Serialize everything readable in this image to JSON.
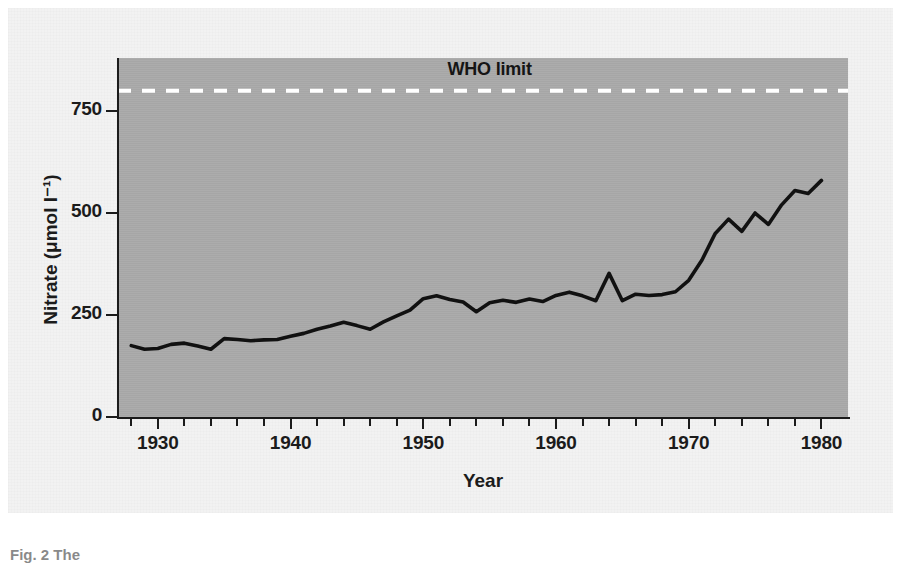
{
  "figure": {
    "caption": "Fig. 2 The",
    "page_background": "#ffffff",
    "card_background": "#f2f2f2"
  },
  "chart_data": {
    "type": "line",
    "title": "",
    "xlabel": "Year",
    "ylabel": "Nitrate (μmol l⁻¹)",
    "xlim": [
      1927,
      1982
    ],
    "ylim": [
      0,
      880
    ],
    "grid": false,
    "legend_position": "none",
    "plot_background": "#a9a9a9",
    "line_color": "#111111",
    "x_ticks_major": [
      1930,
      1940,
      1950,
      1960,
      1970,
      1980
    ],
    "x_tick_labels": [
      "1930",
      "1940",
      "1950",
      "1960",
      "1970",
      "1980"
    ],
    "x_tick_minor_step": 2,
    "y_ticks_major": [
      0,
      250,
      500,
      750
    ],
    "y_tick_labels": [
      "0",
      "250",
      "500",
      "750"
    ],
    "annotations": [
      {
        "name": "who-limit",
        "label": "WHO limit",
        "value": 800,
        "style": "dashed",
        "color": "#ffffff",
        "label_x": 1955
      }
    ],
    "series": [
      {
        "name": "Nitrate concentration",
        "x": [
          1928,
          1929,
          1930,
          1931,
          1932,
          1933,
          1934,
          1935,
          1936,
          1937,
          1938,
          1939,
          1940,
          1941,
          1942,
          1943,
          1944,
          1945,
          1946,
          1947,
          1948,
          1949,
          1950,
          1951,
          1952,
          1953,
          1954,
          1955,
          1956,
          1957,
          1958,
          1959,
          1960,
          1961,
          1962,
          1963,
          1964,
          1965,
          1966,
          1967,
          1968,
          1969,
          1970,
          1971,
          1972,
          1973,
          1974,
          1975,
          1976,
          1977,
          1978,
          1979,
          1980
        ],
        "values": [
          175,
          166,
          168,
          178,
          181,
          174,
          166,
          192,
          190,
          187,
          189,
          190,
          198,
          205,
          215,
          223,
          232,
          224,
          215,
          233,
          248,
          262,
          290,
          297,
          288,
          282,
          258,
          280,
          286,
          281,
          289,
          283,
          298,
          306,
          297,
          285,
          352,
          285,
          301,
          298,
          300,
          307,
          335,
          385,
          450,
          485,
          455,
          500,
          472,
          520,
          555,
          548,
          580
        ]
      }
    ]
  },
  "axes": {
    "y_axis_name": "nitrate-axis",
    "x_axis_name": "year-axis"
  }
}
